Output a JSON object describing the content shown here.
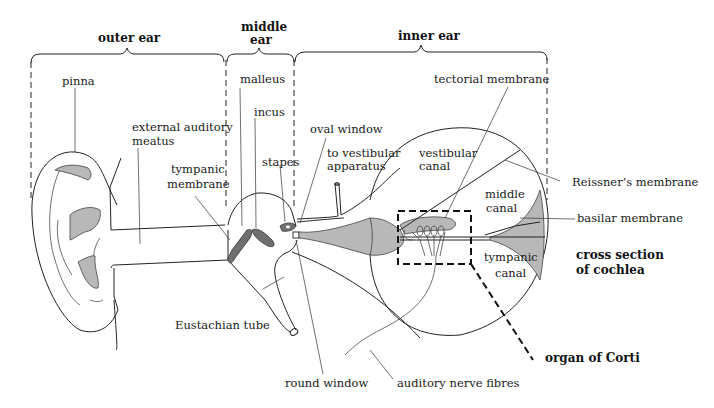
{
  "diagram": {
    "type": "anatomical-labeled-diagram",
    "sections": [
      {
        "id": "outer",
        "label": "outer ear"
      },
      {
        "id": "middle",
        "label_line1": "middle",
        "label_line2": "ear"
      },
      {
        "id": "inner",
        "label": "inner ear"
      }
    ],
    "labels": {
      "pinna": "pinna",
      "ext_meatus_1": "external auditory",
      "ext_meatus_2": "meatus",
      "tympanic_1": "tympanic",
      "tympanic_2": "membrane",
      "malleus": "malleus",
      "incus": "incus",
      "stapes": "stapes",
      "oval_window": "oval window",
      "vestibular_app_1": "to vestibular",
      "vestibular_app_2": "apparatus",
      "tectorial": "tectorial membrane",
      "vestibular_canal_1": "vestibular",
      "vestibular_canal_2": "canal",
      "reissner": "Reissner’s membrane",
      "middle_canal_1": "middle",
      "middle_canal_2": "canal",
      "basilar": "basilar membrane",
      "tympanic_canal_1": "tympanic",
      "tympanic_canal_2": "canal",
      "cross_section_1": "cross section",
      "cross_section_2": "of cochlea",
      "eustachian": "Eustachian tube",
      "round_window": "round window",
      "auditory_nerve": "auditory nerve fibres",
      "organ_of_corti": "organ of  Corti"
    },
    "colors": {
      "line": "#222222",
      "shading_light": "#b8b8b8",
      "shading_dark": "#707070",
      "background": "#ffffff"
    }
  }
}
